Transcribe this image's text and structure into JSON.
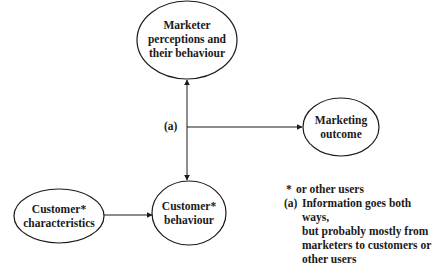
{
  "nodes": {
    "marketer": {
      "label": "Marketer\nperceptions and\ntheir behaviour"
    },
    "outcome": {
      "label": "Marketing\noutcome"
    },
    "characteristics": {
      "label": "Customer*\ncharacteristics"
    },
    "behaviour": {
      "label": "Customer*\nbehaviour"
    }
  },
  "edges": [
    {
      "from": "behaviour",
      "to": "marketer",
      "type": "bidirectional"
    },
    {
      "from": "junction_a",
      "to": "outcome",
      "type": "arrow"
    },
    {
      "from": "characteristics",
      "to": "behaviour",
      "type": "arrow"
    }
  ],
  "annotation_a": "(a)",
  "legend": {
    "items": [
      {
        "mark": "*",
        "text": "or other users"
      },
      {
        "mark": "(a)",
        "text": "Information goes both ways,\nbut probably mostly from\nmarketers to customers or\nother users"
      }
    ]
  }
}
